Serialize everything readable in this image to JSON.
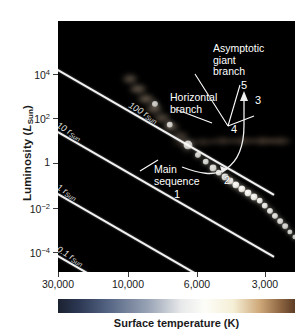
{
  "figure": {
    "kind": "hertzsprung-russell-diagram",
    "background": "#ffffff",
    "panel_background": "#000000"
  },
  "axes": {
    "y": {
      "title_main": "Luminosity (",
      "title_italic": "L",
      "title_sub": "Sun",
      "title_close": ")",
      "ticks": [
        {
          "label_base": "10",
          "label_exp": "4",
          "value": 10000,
          "y": 74
        },
        {
          "label_base": "10",
          "label_exp": "2",
          "value": 100,
          "y": 118
        },
        {
          "label_base": "1",
          "label_exp": "",
          "value": 1,
          "y": 163
        },
        {
          "label_base": "10",
          "label_exp": "−2",
          "value": 0.01,
          "y": 208
        },
        {
          "label_base": "10",
          "label_exp": "−4",
          "value": 0.0001,
          "y": 252
        }
      ]
    },
    "x": {
      "title": "Surface temperature (K)",
      "ticks": [
        {
          "label": "30,000",
          "value": 30000,
          "x": 58
        },
        {
          "label": "10,000",
          "value": 10000,
          "x": 128
        },
        {
          "label": "6,000",
          "value": 6000,
          "x": 197
        },
        {
          "label": "3,000",
          "value": 3000,
          "x": 265
        }
      ]
    }
  },
  "radius_lines": [
    {
      "label_value": "100",
      "label_sym": " r",
      "label_sub": "Sun",
      "x1": 0,
      "y1": 34,
      "x2": 155,
      "y2": 0,
      "angle_deg": 30,
      "start_x": 0,
      "start_y": 48,
      "length": 250
    },
    {
      "label_value": "10",
      "label_sym": " r",
      "label_sub": "Sun",
      "angle_deg": 30,
      "start_x": 0,
      "start_y": 110,
      "length": 250
    },
    {
      "label_value": "1",
      "label_sym": " r",
      "label_sub": "Sun",
      "angle_deg": 30,
      "start_x": 0,
      "start_y": 172,
      "length": 250
    },
    {
      "label_value": "0.1",
      "label_sym": " r",
      "label_sub": "Sun",
      "angle_deg": 30,
      "start_x": 0,
      "start_y": 234,
      "length": 250
    }
  ],
  "annotations": [
    {
      "name": "asymptotic-giant-branch",
      "text": "Asymptotic\ngiant\nbranch",
      "x": 155,
      "y": 22
    },
    {
      "name": "horizontal-branch",
      "text": "Horizontal\nbranch",
      "x": 112,
      "y": 71
    },
    {
      "name": "main-sequence",
      "text": "Main\nsequence",
      "x": 96,
      "y": 143
    }
  ],
  "stage_numbers": [
    {
      "label": "1",
      "x": 174,
      "y": 188
    },
    {
      "label": "2",
      "x": 224,
      "y": 174
    },
    {
      "label": "3",
      "x": 255,
      "y": 94
    },
    {
      "label": "4",
      "x": 231,
      "y": 123
    },
    {
      "label": "5",
      "x": 241,
      "y": 79
    }
  ],
  "chart_data": {
    "type": "scatter",
    "title": "",
    "xlabel": "Surface temperature (K)",
    "ylabel": "Luminosity (L_Sun)",
    "xscale": "log-reversed",
    "yscale": "log",
    "xlim": [
      30000,
      2400
    ],
    "ylim": [
      1e-05,
      1000000.0
    ],
    "xticks": [
      30000,
      10000,
      6000,
      3000
    ],
    "yticks": [
      10000,
      100,
      1,
      0.01,
      0.0001
    ],
    "grid": false,
    "legend": "none",
    "series": [
      {
        "name": "Main sequence stars",
        "note": "Bright white dots running from upper-left (hot, luminous) to lower-right (cool, faint)",
        "points": [
          {
            "x_px": 97,
            "y_px": 83,
            "r": 3.0,
            "b": 0.8
          },
          {
            "x_px": 112,
            "y_px": 104,
            "r": 3.2,
            "b": 0.82
          },
          {
            "x_px": 130,
            "y_px": 124,
            "r": 4.4,
            "b": 0.86
          },
          {
            "x_px": 140,
            "y_px": 134,
            "r": 3.0,
            "b": 0.86
          },
          {
            "x_px": 148,
            "y_px": 141,
            "r": 3.2,
            "b": 0.88
          },
          {
            "x_px": 155,
            "y_px": 147,
            "r": 3.4,
            "b": 0.9
          },
          {
            "x_px": 161,
            "y_px": 152,
            "r": 3.2,
            "b": 0.92
          },
          {
            "x_px": 167,
            "y_px": 156,
            "r": 3.4,
            "b": 0.94
          },
          {
            "x_px": 172,
            "y_px": 160,
            "r": 3.4,
            "b": 0.96
          },
          {
            "x_px": 178,
            "y_px": 164,
            "r": 3.6,
            "b": 1.0
          },
          {
            "x_px": 184,
            "y_px": 168,
            "r": 3.6,
            "b": 1.0
          },
          {
            "x_px": 190,
            "y_px": 172,
            "r": 3.4,
            "b": 1.0
          },
          {
            "x_px": 196,
            "y_px": 176,
            "r": 3.4,
            "b": 0.98
          },
          {
            "x_px": 202,
            "y_px": 180,
            "r": 3.2,
            "b": 0.96
          },
          {
            "x_px": 207,
            "y_px": 185,
            "r": 3.2,
            "b": 0.94
          },
          {
            "x_px": 212,
            "y_px": 190,
            "r": 3.0,
            "b": 0.92
          },
          {
            "x_px": 217,
            "y_px": 195,
            "r": 3.0,
            "b": 0.9
          },
          {
            "x_px": 222,
            "y_px": 200,
            "r": 2.8,
            "b": 0.88
          },
          {
            "x_px": 227,
            "y_px": 205,
            "r": 2.8,
            "b": 0.86
          },
          {
            "x_px": 232,
            "y_px": 211,
            "r": 2.6,
            "b": 0.84
          },
          {
            "x_px": 237,
            "y_px": 216,
            "r": 2.6,
            "b": 0.82
          },
          {
            "x_px": 242,
            "y_px": 221,
            "r": 2.4,
            "b": 0.8
          },
          {
            "x_px": 246,
            "y_px": 226,
            "r": 2.4,
            "b": 0.78
          },
          {
            "x_px": 250,
            "y_px": 230,
            "r": 2.2,
            "b": 0.74
          },
          {
            "x_px": 254,
            "y_px": 234,
            "r": 2.0,
            "b": 0.7
          },
          {
            "x_px": 257,
            "y_px": 238,
            "r": 1.8,
            "b": 0.66
          },
          {
            "x_px": 260,
            "y_px": 242,
            "r": 1.6,
            "b": 0.6
          }
        ]
      },
      {
        "name": "Red giant branch cloud",
        "note": "Diffuse glow sweeping from the main sequence turnoff up to the upper right",
        "points": [
          {
            "x_px": 72,
            "y_px": 58,
            "rx": 8,
            "ry": 5,
            "b": 0.45
          },
          {
            "x_px": 80,
            "y_px": 68,
            "rx": 9,
            "ry": 5,
            "b": 0.5
          },
          {
            "x_px": 88,
            "y_px": 78,
            "rx": 9,
            "ry": 5,
            "b": 0.52
          },
          {
            "x_px": 96,
            "y_px": 88,
            "rx": 9,
            "ry": 5,
            "b": 0.48
          },
          {
            "x_px": 104,
            "y_px": 97,
            "rx": 9,
            "ry": 5,
            "b": 0.44
          },
          {
            "x_px": 113,
            "y_px": 106,
            "rx": 9,
            "ry": 5,
            "b": 0.4
          },
          {
            "x_px": 122,
            "y_px": 115,
            "rx": 9,
            "ry": 5,
            "b": 0.36
          }
        ]
      },
      {
        "name": "Horizontal branch cloud",
        "note": "Flat dim band at about L = 100 L_Sun stretching to the right",
        "points": [
          {
            "x_px": 125,
            "y_px": 122,
            "rx": 12,
            "ry": 4,
            "b": 0.22
          },
          {
            "x_px": 145,
            "y_px": 121,
            "rx": 13,
            "ry": 4,
            "b": 0.26
          },
          {
            "x_px": 165,
            "y_px": 120,
            "rx": 13,
            "ry": 4,
            "b": 0.3
          },
          {
            "x_px": 185,
            "y_px": 120,
            "rx": 13,
            "ry": 4,
            "b": 0.34
          },
          {
            "x_px": 205,
            "y_px": 120,
            "rx": 13,
            "ry": 4,
            "b": 0.36
          },
          {
            "x_px": 222,
            "y_px": 120,
            "rx": 12,
            "ry": 4,
            "b": 0.34
          }
        ]
      },
      {
        "name": "Cool low-luminosity cloud",
        "note": "Dim reddish haze along the lower right end of the main sequence",
        "points": [
          {
            "x_px": 252,
            "y_px": 228,
            "rx": 10,
            "ry": 8,
            "b": 0.22
          },
          {
            "x_px": 260,
            "y_px": 240,
            "rx": 10,
            "ry": 9,
            "b": 0.24
          },
          {
            "x_px": 266,
            "y_px": 250,
            "rx": 9,
            "ry": 8,
            "b": 0.2
          }
        ]
      }
    ],
    "evolutionary_track": {
      "name": "Stellar evolution track (stages 1-5)",
      "stages": [
        {
          "label": "1",
          "description": "main-sequence turnoff"
        },
        {
          "label": "2",
          "description": "subgiant / red giant branch base"
        },
        {
          "label": "3",
          "description": "red giant branch tip"
        },
        {
          "label": "4",
          "description": "horizontal branch"
        },
        {
          "label": "5",
          "description": "asymptotic giant branch"
        }
      ]
    }
  },
  "colorbar": {
    "name": "temperature-colorbar",
    "stops": [
      {
        "pos": 0,
        "color": "#1b2230"
      },
      {
        "pos": 8,
        "color": "#2a3550"
      },
      {
        "pos": 20,
        "color": "#50607f"
      },
      {
        "pos": 38,
        "color": "#98a3b5"
      },
      {
        "pos": 52,
        "color": "#e8e9ea"
      },
      {
        "pos": 62,
        "color": "#fdfdf8"
      },
      {
        "pos": 74,
        "color": "#f5efd6"
      },
      {
        "pos": 85,
        "color": "#cfa97a"
      },
      {
        "pos": 94,
        "color": "#8c6440"
      },
      {
        "pos": 100,
        "color": "#5d3d26"
      }
    ]
  }
}
